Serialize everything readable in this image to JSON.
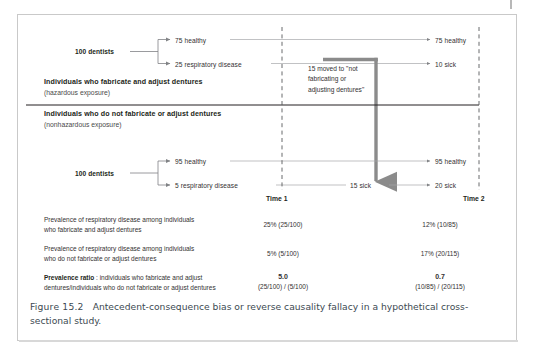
{
  "figure": {
    "caption_label": "Figure 15.2",
    "caption_text": "Antecedent-consequence bias or reverse causality fallacy in a hypothetical cross-sectional study."
  },
  "timeline": {
    "time1": "Time 1",
    "time2": "Time 2"
  },
  "groups": [
    {
      "title": "Individuals who fabricate and adjust dentures",
      "subtitle": "(hazardous exposure)",
      "source": "100 dentists",
      "t1_branches": [
        "75 healthy",
        "25 respiratory disease"
      ],
      "t2_branches": [
        "75 healthy",
        "10 sick"
      ]
    },
    {
      "title": "Individuals who do not fabricate or adjust dentures",
      "subtitle": "(nonhazardous exposure)",
      "source": "100 dentists",
      "t1_branches": [
        "95 healthy",
        "5 respiratory disease"
      ],
      "t2_branches": [
        "95 healthy",
        "20 sick"
      ]
    }
  ],
  "flow_note": "15 moved to \"not\nfabricating or\nadjusting dentures\"",
  "flow_note_lines": [
    "15 moved to \"not",
    "fabricating or",
    "adjusting dentures\""
  ],
  "mid_label": "15 sick",
  "table": {
    "rows": [
      {
        "lead": "",
        "desc_line1": "Prevalence of respiratory disease among individuals",
        "desc_line2": "who fabricate and adjust dentures",
        "time1_value": "25% (25/100)",
        "time1_detail": "",
        "time2_value": "12% (10/85)",
        "time2_detail": "",
        "bold": false
      },
      {
        "lead": "",
        "desc_line1": "Prevalence of respiratory disease among individuals",
        "desc_line2": "who do not fabricate or adjust dentures",
        "time1_value": "5% (5/100)",
        "time1_detail": "",
        "time2_value": "17% (20/115)",
        "time2_detail": "",
        "bold": false
      },
      {
        "lead": "Prevalence ratio",
        "desc_line1": " : individuals who fabricate and adjust",
        "desc_line2": "dentures/individuals who do not fabricate or adjust dentures",
        "time1_value": "5.0",
        "time1_detail": "(25/100) / (5/100)",
        "time2_value": "0.7",
        "time2_detail": "(10/85) / (20/115)",
        "bold": true
      }
    ]
  },
  "colors": {
    "text": "#231f20",
    "line": "#808285",
    "flow_arrow": "#8b8b8b",
    "divider": "#231f20",
    "caption": "#3d4a52",
    "border": "#c9c9c9"
  }
}
